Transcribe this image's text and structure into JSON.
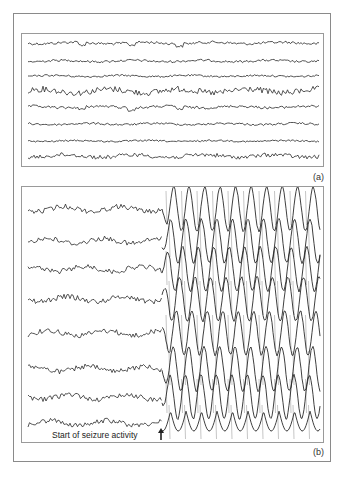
{
  "figure": {
    "panels": [
      {
        "id": "a",
        "label": "(a)",
        "description": "Normal EEG, 8 channels",
        "channels": 8
      },
      {
        "id": "b",
        "label": "(b)",
        "description": "EEG with seizure onset, 8 channels",
        "channels": 8
      }
    ],
    "annotation": {
      "text": "Start of seizure activity",
      "icon": "up-arrow-icon"
    },
    "colors": {
      "trace": "#2a2a2a",
      "frame": "#8a8a8a",
      "background": "#ffffff"
    }
  }
}
